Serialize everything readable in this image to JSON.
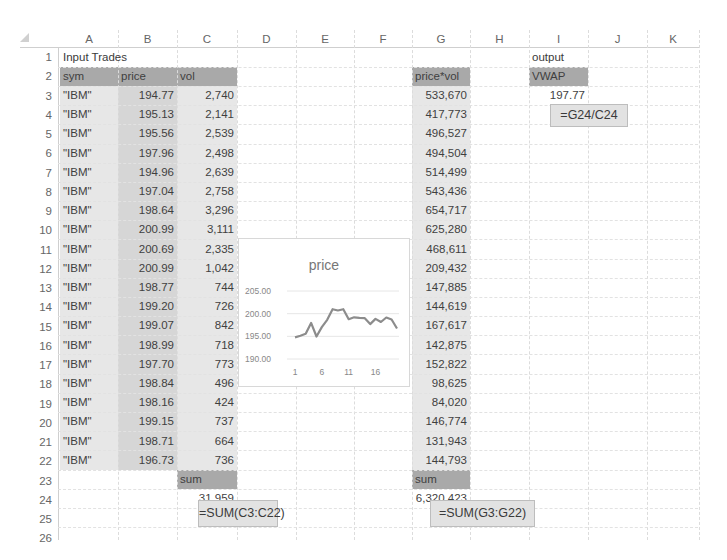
{
  "columns": [
    "A",
    "B",
    "C",
    "D",
    "E",
    "F",
    "G",
    "H",
    "I",
    "J",
    "K"
  ],
  "rows": [
    1,
    2,
    3,
    4,
    5,
    6,
    7,
    8,
    9,
    10,
    11,
    12,
    13,
    14,
    15,
    16,
    17,
    18,
    19,
    20,
    21,
    22,
    23,
    24,
    25,
    26
  ],
  "input_section": {
    "title": "Input Trades",
    "headers": {
      "sym": "sym",
      "price": "price",
      "vol": "vol"
    },
    "trades": [
      {
        "sym": "\"IBM\"",
        "price": "194.77",
        "vol": "2,740"
      },
      {
        "sym": "\"IBM\"",
        "price": "195.13",
        "vol": "2,141"
      },
      {
        "sym": "\"IBM\"",
        "price": "195.56",
        "vol": "2,539"
      },
      {
        "sym": "\"IBM\"",
        "price": "197.96",
        "vol": "2,498"
      },
      {
        "sym": "\"IBM\"",
        "price": "194.96",
        "vol": "2,639"
      },
      {
        "sym": "\"IBM\"",
        "price": "197.04",
        "vol": "2,758"
      },
      {
        "sym": "\"IBM\"",
        "price": "198.64",
        "vol": "3,296"
      },
      {
        "sym": "\"IBM\"",
        "price": "200.99",
        "vol": "3,111"
      },
      {
        "sym": "\"IBM\"",
        "price": "200.69",
        "vol": "2,335"
      },
      {
        "sym": "\"IBM\"",
        "price": "200.99",
        "vol": "1,042"
      },
      {
        "sym": "\"IBM\"",
        "price": "198.77",
        "vol": "744"
      },
      {
        "sym": "\"IBM\"",
        "price": "199.20",
        "vol": "726"
      },
      {
        "sym": "\"IBM\"",
        "price": "199.07",
        "vol": "842"
      },
      {
        "sym": "\"IBM\"",
        "price": "198.99",
        "vol": "718"
      },
      {
        "sym": "\"IBM\"",
        "price": "197.70",
        "vol": "773"
      },
      {
        "sym": "\"IBM\"",
        "price": "198.84",
        "vol": "496"
      },
      {
        "sym": "\"IBM\"",
        "price": "198.16",
        "vol": "424"
      },
      {
        "sym": "\"IBM\"",
        "price": "199.15",
        "vol": "737"
      },
      {
        "sym": "\"IBM\"",
        "price": "198.71",
        "vol": "664"
      },
      {
        "sym": "\"IBM\"",
        "price": "196.73",
        "vol": "736"
      }
    ],
    "sum_label": "sum",
    "vol_sum": "31,959",
    "vol_sum_formula": "=SUM(C3:C22)"
  },
  "pricevol_section": {
    "header": "price*vol",
    "values": [
      "533,670",
      "417,773",
      "496,527",
      "494,504",
      "514,499",
      "543,436",
      "654,717",
      "625,280",
      "468,611",
      "209,432",
      "147,885",
      "144,619",
      "167,617",
      "142,875",
      "152,822",
      "98,625",
      "84,020",
      "146,774",
      "131,943",
      "144,793"
    ],
    "sum_label": "sum",
    "sum": "6,320,423",
    "sum_formula": "=SUM(G3:G22)"
  },
  "output_section": {
    "title": "output",
    "header": "VWAP",
    "value": "197.77",
    "formula": "=G24/C24"
  },
  "chart_data": {
    "type": "line",
    "title": "price",
    "x": [
      1,
      2,
      3,
      4,
      5,
      6,
      7,
      8,
      9,
      10,
      11,
      12,
      13,
      14,
      15,
      16,
      17,
      18,
      19,
      20
    ],
    "x_tick_labels": [
      "1",
      "6",
      "11",
      "16"
    ],
    "series": [
      {
        "name": "price",
        "values": [
          194.77,
          195.13,
          195.56,
          197.96,
          194.96,
          197.04,
          198.64,
          200.99,
          200.69,
          200.99,
          198.77,
          199.2,
          199.07,
          198.99,
          197.7,
          198.84,
          198.16,
          199.15,
          198.71,
          196.73
        ]
      }
    ],
    "y_tick_labels": [
      "190.00",
      "195.00",
      "200.00",
      "205.00"
    ],
    "ylim": [
      190,
      205
    ],
    "xlabel": "",
    "ylabel": "",
    "grid": true,
    "legend": "none",
    "line_color": "#8c8c8c"
  }
}
